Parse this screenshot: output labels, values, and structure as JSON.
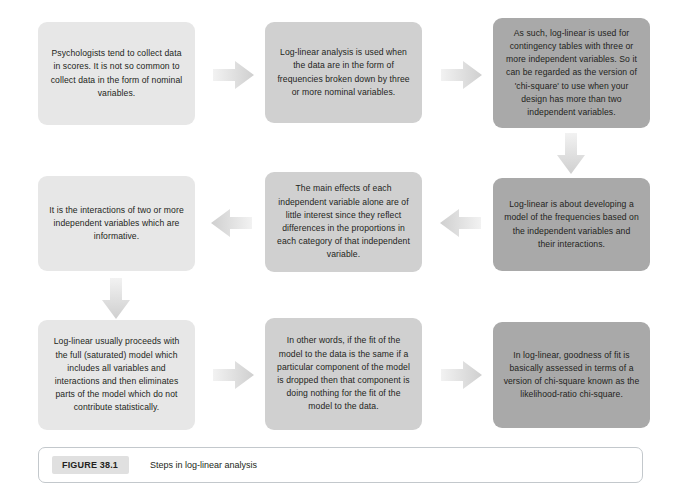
{
  "figure": {
    "number_label": "FIGURE 38.1",
    "caption": "Steps in log-linear analysis"
  },
  "colors": {
    "box_light": "#e7e7e7",
    "box_mid": "#d0d0d0",
    "box_dark": "#a9a9a9",
    "arrow": "#d9d9d9",
    "text": "#231f20",
    "caption_border": "#c3c8cc",
    "figure_number_bg": "#e0e0e0",
    "page_background": "#ffffff"
  },
  "flowchart": {
    "type": "flowchart",
    "title": "Steps in log-linear analysis",
    "grid": {
      "rows": 3,
      "columns": 3
    },
    "nodes": [
      {
        "id": "n1",
        "row": 1,
        "column": 1,
        "shade": "light",
        "text": "Psychologists tend to collect data in scores. It is not so common to collect data in the form of nominal variables."
      },
      {
        "id": "n2",
        "row": 1,
        "column": 2,
        "shade": "mid",
        "text": "Log-linear analysis is used when the data are in the form of frequencies broken down by three or more nominal variables."
      },
      {
        "id": "n3",
        "row": 1,
        "column": 3,
        "shade": "dark",
        "text": "As such, log-linear is used for contingency tables with three or more independent variables. So it can be regarded as the version of 'chi-square' to use when your design has more than two independent variables."
      },
      {
        "id": "n4",
        "row": 2,
        "column": 1,
        "shade": "light",
        "text": "It is the interactions of two or more independent variables which are informative."
      },
      {
        "id": "n5",
        "row": 2,
        "column": 2,
        "shade": "mid",
        "text": "The main effects of each independent variable alone are of little interest since they reflect differences in the proportions in each category of that independent variable."
      },
      {
        "id": "n6",
        "row": 2,
        "column": 3,
        "shade": "dark",
        "text": "Log-linear is about developing a model of the frequencies based on the independent variables and their interactions."
      },
      {
        "id": "n7",
        "row": 3,
        "column": 1,
        "shade": "light",
        "text": "Log-linear usually proceeds with the full (saturated) model which includes all variables and interactions and then eliminates parts of the model which do not contribute statistically."
      },
      {
        "id": "n8",
        "row": 3,
        "column": 2,
        "shade": "mid",
        "text": "In other words, if the fit of the model to the data is the same if a particular component of the model is dropped then that component is doing nothing for the fit of the model to the data."
      },
      {
        "id": "n9",
        "row": 3,
        "column": 3,
        "shade": "dark",
        "text": "In log-linear, goodness of fit is basically assessed in terms of a version of chi-square known as the likelihood-ratio chi-square."
      }
    ],
    "edges": [
      {
        "id": "e1",
        "from": "n1",
        "to": "n2",
        "direction": "right"
      },
      {
        "id": "e2",
        "from": "n2",
        "to": "n3",
        "direction": "right"
      },
      {
        "id": "e3",
        "from": "n3",
        "to": "n6",
        "direction": "down"
      },
      {
        "id": "e4",
        "from": "n6",
        "to": "n5",
        "direction": "left"
      },
      {
        "id": "e5",
        "from": "n5",
        "to": "n4",
        "direction": "left"
      },
      {
        "id": "e6",
        "from": "n4",
        "to": "n7",
        "direction": "down"
      },
      {
        "id": "e7",
        "from": "n7",
        "to": "n8",
        "direction": "right"
      },
      {
        "id": "e8",
        "from": "n8",
        "to": "n9",
        "direction": "right"
      }
    ]
  }
}
